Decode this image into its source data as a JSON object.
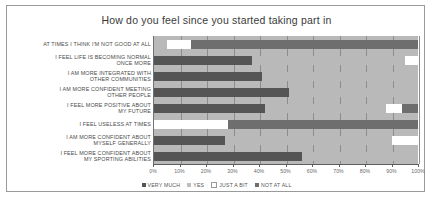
{
  "chart": {
    "title": "How do you feel since you started taking part in"
  },
  "axis": {
    "ticks": [
      "0%",
      "10%",
      "20%",
      "30%",
      "40%",
      "50%",
      "60%",
      "70%",
      "80%",
      "90%",
      "100%"
    ],
    "min": 0,
    "max": 100
  },
  "legend": {
    "items": [
      {
        "label": "VERY MUCH",
        "color": "#555555"
      },
      {
        "label": "YES",
        "color": "#bdbdbd"
      },
      {
        "label": "JUST A BIT",
        "color": "#ffffff"
      },
      {
        "label": "NOT AT ALL",
        "color": "#6e6e6e"
      }
    ]
  },
  "chart_data": {
    "type": "bar",
    "orientation": "horizontal",
    "stacked": true,
    "stack_total": 100,
    "title": "How do you feel since you started taking part in",
    "xlabel": "",
    "ylabel": "",
    "xlim": [
      0,
      100
    ],
    "grid": true,
    "legend_position": "bottom",
    "categories": [
      "AT TIMES I THINK I'M NOT GOOD AT ALL",
      "I FEEL LIFE IS BECOMING NORMAL ONCE MORE",
      "I AM MORE INTEGRATED WITH OTHER COMMUNITIES",
      "I AM MORE CONFIDENT MEETING OTHER PEOPLE",
      "I FEEL MORE POSITIVE ABOUT MY FUTURE",
      "I FEEL USELESS AT TIMES",
      "I AM MORE CONFIDENT ABOUT MYSELF GENERALLY",
      "I FEEL MORE CONFIDENT ABOUT MY SPORTING ABILITIES"
    ],
    "category_lines": [
      [
        "AT TIMES I THINK I'M NOT GOOD AT ALL"
      ],
      [
        "I FEEL LIFE IS BECOMING NORMAL",
        "ONCE MORE"
      ],
      [
        "I AM MORE INTEGRATED WITH",
        "OTHER COMMUNITIES"
      ],
      [
        "I AM MORE CONFIDENT MEETING",
        "OTHER PEOPLE"
      ],
      [
        "I FEEL MORE POSITIVE ABOUT",
        "MY FUTURE"
      ],
      [
        "I FEEL USELESS AT TIMES"
      ],
      [
        "I AM MORE CONFIDENT ABOUT",
        "MYSELF GENERALLY"
      ],
      [
        "I FEEL MORE CONFIDENT ABOUT",
        "MY SPORTING ABILITIES"
      ]
    ],
    "series": [
      {
        "name": "VERY MUCH",
        "values": [
          5,
          37,
          41,
          51,
          42,
          0,
          27,
          56
        ]
      },
      {
        "name": "YES",
        "values": [
          0,
          58,
          59,
          49,
          46,
          0,
          63,
          44
        ]
      },
      {
        "name": "JUST A BIT",
        "values": [
          9,
          5,
          0,
          0,
          6,
          28,
          10,
          0
        ]
      },
      {
        "name": "NOT AT ALL",
        "values": [
          86,
          0,
          0,
          0,
          6,
          72,
          0,
          0
        ]
      }
    ],
    "segments_by_row": [
      [
        {
          "name": "VERY MUCH",
          "start": 0,
          "end": 5,
          "color": "#b9b9b9"
        },
        {
          "name": "JUST A BIT",
          "start": 5,
          "end": 14,
          "color": "#ffffff"
        },
        {
          "name": "NOT AT ALL",
          "start": 14,
          "end": 100,
          "color": "#6e6e6e"
        }
      ],
      [
        {
          "name": "VERY MUCH",
          "start": 0,
          "end": 37,
          "color": "#555555"
        },
        {
          "name": "YES",
          "start": 37,
          "end": 95,
          "color": "#b9b9b9"
        },
        {
          "name": "JUST A BIT",
          "start": 95,
          "end": 100,
          "color": "#ffffff"
        }
      ],
      [
        {
          "name": "VERY MUCH",
          "start": 0,
          "end": 41,
          "color": "#555555"
        },
        {
          "name": "YES",
          "start": 41,
          "end": 100,
          "color": "#b9b9b9"
        }
      ],
      [
        {
          "name": "VERY MUCH",
          "start": 0,
          "end": 51,
          "color": "#555555"
        },
        {
          "name": "YES",
          "start": 51,
          "end": 100,
          "color": "#b9b9b9"
        }
      ],
      [
        {
          "name": "VERY MUCH",
          "start": 0,
          "end": 42,
          "color": "#555555"
        },
        {
          "name": "YES",
          "start": 42,
          "end": 88,
          "color": "#b9b9b9"
        },
        {
          "name": "JUST A BIT",
          "start": 88,
          "end": 94,
          "color": "#ffffff"
        },
        {
          "name": "NOT AT ALL",
          "start": 94,
          "end": 100,
          "color": "#6e6e6e"
        }
      ],
      [
        {
          "name": "JUST A BIT",
          "start": 0,
          "end": 28,
          "color": "#ffffff"
        },
        {
          "name": "NOT AT ALL",
          "start": 28,
          "end": 100,
          "color": "#6e6e6e"
        }
      ],
      [
        {
          "name": "VERY MUCH",
          "start": 0,
          "end": 27,
          "color": "#555555"
        },
        {
          "name": "YES",
          "start": 27,
          "end": 90,
          "color": "#b9b9b9"
        },
        {
          "name": "JUST A BIT",
          "start": 90,
          "end": 100,
          "color": "#ffffff"
        }
      ],
      [
        {
          "name": "VERY MUCH",
          "start": 0,
          "end": 56,
          "color": "#555555"
        },
        {
          "name": "YES",
          "start": 56,
          "end": 100,
          "color": "#b9b9b9"
        }
      ]
    ]
  }
}
